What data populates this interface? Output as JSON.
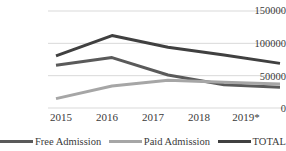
{
  "chart_data": {
    "type": "line",
    "title": "",
    "subtitle": "",
    "xlabel": "",
    "ylabel": "",
    "categories": [
      "2015",
      "2016",
      "2017",
      "2018",
      "2019*"
    ],
    "ylim": [
      0,
      150000
    ],
    "xlim": [
      0,
      4
    ],
    "grid": true,
    "gridlines_y": [
      0,
      50000,
      100000,
      150000
    ],
    "y_tick_labels": [
      "150000",
      "100000",
      "50000",
      "0"
    ],
    "legend_position": "bottom",
    "series": [
      {
        "name": "Free  Admission",
        "color": "#5a5a5a",
        "values": [
          66000,
          78000,
          51000,
          36000,
          32000
        ]
      },
      {
        "name": "Paid  Admission",
        "color": "#a6a6a6",
        "values": [
          14500,
          34000,
          43000,
          40000,
          37000
        ]
      },
      {
        "name": "TOTAL",
        "color": "#404040",
        "values": [
          80500,
          112000,
          94000,
          82000,
          69000
        ]
      }
    ],
    "axis_color": "#d9d9d9",
    "text_color": "#3a3a3a"
  },
  "legend": {
    "items": [
      {
        "label": "Free  Admission"
      },
      {
        "label": "Paid  Admission"
      },
      {
        "label": "TOTAL"
      }
    ]
  },
  "y_axis": {
    "ticks": [
      {
        "label": "150000"
      },
      {
        "label": "100000"
      },
      {
        "label": "50000"
      },
      {
        "label": "0"
      }
    ]
  },
  "x_axis": {
    "ticks": [
      {
        "label": "2015"
      },
      {
        "label": "2016"
      },
      {
        "label": "2017"
      },
      {
        "label": "2018"
      },
      {
        "label": "2019*"
      }
    ]
  }
}
